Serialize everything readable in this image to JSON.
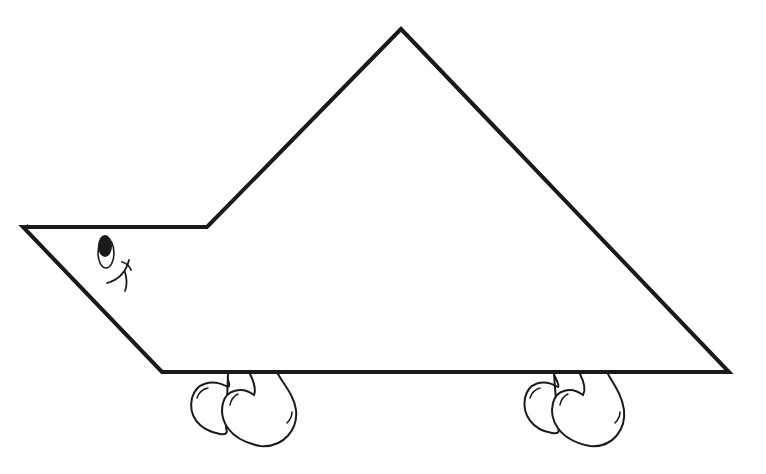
{
  "figure": {
    "stroke_color": "#1a1a1a",
    "background_color": "#ffffff",
    "body": {
      "shape": "polygon",
      "points": [
        [
          23,
          227
        ],
        [
          207,
          227
        ],
        [
          401,
          29
        ],
        [
          729,
          372
        ],
        [
          162,
          372
        ]
      ]
    },
    "face": {
      "eye": {
        "cx": 105,
        "cy": 250
      },
      "smile": true
    },
    "wheels": [
      {
        "name": "front-wheel-pair",
        "x": 190
      },
      {
        "name": "rear-wheel-pair",
        "x": 522
      }
    ]
  }
}
